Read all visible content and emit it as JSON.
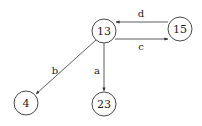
{
  "diagram": {
    "type": "directed-graph",
    "nodes": [
      {
        "id": "13",
        "label": "13",
        "x": 104,
        "y": 31,
        "r": 12
      },
      {
        "id": "15",
        "label": "15",
        "x": 180,
        "y": 29,
        "r": 12
      },
      {
        "id": "4",
        "label": "4",
        "x": 26,
        "y": 103,
        "r": 12
      },
      {
        "id": "23",
        "label": "23",
        "x": 104,
        "y": 104,
        "r": 12
      }
    ],
    "edges": [
      {
        "from": "15",
        "to": "13",
        "label": "d"
      },
      {
        "from": "13",
        "to": "15",
        "label": "c"
      },
      {
        "from": "13",
        "to": "4",
        "label": "b"
      },
      {
        "from": "13",
        "to": "23",
        "label": "a"
      }
    ]
  }
}
